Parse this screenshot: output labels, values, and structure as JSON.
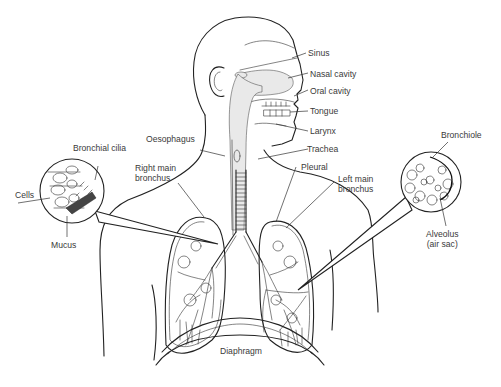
{
  "diagram": {
    "labels": {
      "sinus": "Sinus",
      "nasal_cavity": "Nasal cavity",
      "oral_cavity": "Oral cavity",
      "tongue": "Tongue",
      "larynx": "Larynx",
      "trachea": "Trachea",
      "oesophagus": "Oesophagus",
      "bronchial_cilia": "Bronchial cilia",
      "cells": "Cells",
      "mucus": "Mucus",
      "right_main_bronchus_1": "Right main",
      "right_main_bronchus_2": "bronchus",
      "pleural": "Pleural",
      "left_main_bronchus_1": "Left main",
      "left_main_bronchus_2": "bronchus",
      "bronchiole": "Bronchiole",
      "alveolus_1": "Alveolus",
      "alveolus_2": "(air sac)",
      "diaphragm": "Diaphragm"
    },
    "insets": {
      "left": {
        "subject": "bronchial lining",
        "center": [
          72,
          191
        ],
        "radius": 32
      },
      "right": {
        "subject": "alveoli",
        "center": [
          431,
          182
        ],
        "radius": 30
      }
    },
    "colors": {
      "line": "#222222",
      "text": "#3a3a3a",
      "background": "#ffffff",
      "shade": "#e9e9e9"
    }
  }
}
